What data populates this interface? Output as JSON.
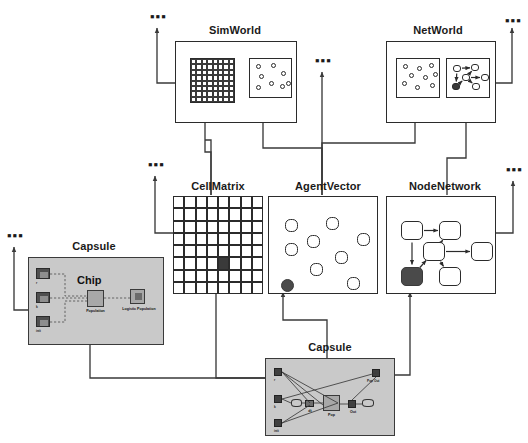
{
  "diagram": {
    "background_color": "#ffffff",
    "line_color": "#3a3a3a",
    "capsule_fill": "#c9c9c9",
    "highlight_fill": "#4a4a4a"
  },
  "ellipses": {
    "glyph": "▪▪▪",
    "items": [
      {
        "name": "ellipsis-above-simworld"
      },
      {
        "name": "ellipsis-above-agentvector-top"
      },
      {
        "name": "ellipsis-above-networld"
      },
      {
        "name": "ellipsis-above-cellmatrix"
      },
      {
        "name": "ellipsis-above-nodenetwork"
      },
      {
        "name": "ellipsis-above-capsule-left"
      }
    ]
  },
  "top_layer": {
    "nodes": [
      {
        "id": "simworld",
        "label": "SimWorld",
        "inner_panels": [
          {
            "id": "simworld-grid",
            "kind": "cell-grid",
            "rows": 8,
            "cols": 8
          },
          {
            "id": "simworld-agents",
            "kind": "agent-cloud",
            "agent_count": 8
          }
        ]
      },
      {
        "id": "networld",
        "label": "NetWorld",
        "inner_panels": [
          {
            "id": "networld-agents",
            "kind": "agent-cloud",
            "agent_count": 9
          },
          {
            "id": "networld-graph",
            "kind": "node-graph",
            "node_count": 6,
            "filled_nodes": 1
          }
        ]
      }
    ]
  },
  "middle_layer": {
    "nodes": [
      {
        "id": "cellmatrix",
        "label": "CellMatrix",
        "kind": "cell-grid",
        "rows": 8,
        "cols": 8,
        "active_cell": {
          "row": 5,
          "col": 4
        }
      },
      {
        "id": "agentvector",
        "label": "AgentVector",
        "kind": "agent-cloud",
        "agent_count": 9,
        "filled_agent_index": 8
      },
      {
        "id": "nodenetwork",
        "label": "NodeNetwork",
        "kind": "node-graph",
        "node_count": 6,
        "filled_node_index": 3
      }
    ]
  },
  "bottom_layer": {
    "capsules": [
      {
        "id": "capsule-left",
        "label": "Capsule",
        "chip": {
          "title": "Chip",
          "main_block_label": "Population",
          "secondary_block_label": "Logistic Population"
        },
        "ports": [
          {
            "id": "port-r",
            "label": "r"
          },
          {
            "id": "port-k",
            "label": "k"
          },
          {
            "id": "port-init",
            "label": "init"
          }
        ]
      },
      {
        "id": "capsule-bottom",
        "label": "Capsule",
        "ports": [
          {
            "id": "port-r",
            "label": "r"
          },
          {
            "id": "port-k",
            "label": "k"
          },
          {
            "id": "port-init",
            "label": "init"
          },
          {
            "id": "port-pop-out",
            "label": "Pop Out"
          }
        ],
        "blocks": [
          {
            "id": "block-pop",
            "label": "Pop"
          },
          {
            "id": "block-dpop",
            "label": "dt"
          },
          {
            "id": "block-out",
            "label": "Out"
          }
        ]
      }
    ]
  }
}
